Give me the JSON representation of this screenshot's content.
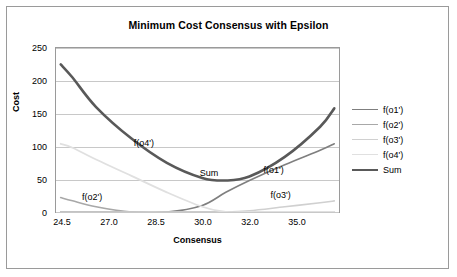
{
  "chart_data": {
    "type": "line",
    "title": "Minimum Cost Consensus with Epsilon",
    "xlabel": "Consensus",
    "ylabel": "Cost",
    "xlim": [
      23.8,
      35.8
    ],
    "ylim": [
      0,
      250
    ],
    "yticks": [
      "0",
      "50",
      "100",
      "150",
      "200",
      "250"
    ],
    "xticks": [
      "24.5",
      "27.0",
      "28.5",
      "30.0",
      "32.0",
      "35.0"
    ],
    "grid": true,
    "legend_position": "right",
    "x": [
      24.0,
      24.5,
      25.5,
      27.0,
      28.5,
      30.0,
      31.0,
      32.0,
      33.5,
      35.0,
      35.6
    ],
    "series": [
      {
        "name": "f(o1')",
        "color": "#7f7f7f",
        "width": 1.6,
        "values": [
          0,
          0,
          0,
          0,
          0,
          10,
          30,
          48,
          72,
          94,
          104
        ]
      },
      {
        "name": "f(o2')",
        "color": "#a8a8a8",
        "width": 1.6,
        "values": [
          22,
          17,
          8,
          0,
          0,
          0,
          0,
          0,
          0,
          0,
          0
        ]
      },
      {
        "name": "f(o3')",
        "color": "#d0d0d0",
        "width": 1.6,
        "values": [
          0,
          0,
          0,
          0,
          0,
          0,
          0,
          2,
          8,
          14,
          17
        ]
      },
      {
        "name": "f(o4')",
        "color": "#e0e0e0",
        "width": 1.8,
        "values": [
          104,
          98,
          80,
          55,
          30,
          8,
          0,
          0,
          0,
          0,
          0
        ]
      },
      {
        "name": "Sum",
        "color": "#595959",
        "width": 2.6,
        "values": [
          225,
          205,
          160,
          112,
          75,
          52,
          48,
          54,
          84,
          130,
          158
        ]
      }
    ],
    "annotations": [
      {
        "text": "f(o4')",
        "x": 27.1,
        "y": 103
      },
      {
        "text": "f(o2')",
        "x": 24.9,
        "y": 22
      },
      {
        "text": "Sum",
        "x": 29.9,
        "y": 58
      },
      {
        "text": "f(o1')",
        "x": 32.6,
        "y": 62
      },
      {
        "text": "f(o3')",
        "x": 32.9,
        "y": 25
      }
    ]
  },
  "legend": {
    "items": [
      {
        "label": "f(o1')"
      },
      {
        "label": "f(o2')"
      },
      {
        "label": "f(o3')"
      },
      {
        "label": "f(o4')"
      },
      {
        "label": "Sum"
      }
    ]
  }
}
